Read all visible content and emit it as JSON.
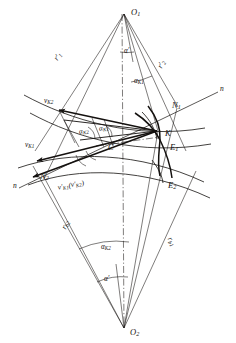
{
  "figure": {
    "type": "technical-line-diagram",
    "background": "#ffffff",
    "ink_color": "#14110f",
    "width": 236,
    "height": 343
  },
  "points": [
    {
      "id": "O1",
      "base": "O",
      "sub": "1",
      "x": 125,
      "y": 12,
      "label_dx": 6,
      "label_dy": 0
    },
    {
      "id": "O2",
      "base": "O",
      "sub": "2",
      "x": 124,
      "y": 329,
      "label_dx": 6,
      "label_dy": 4
    },
    {
      "id": "K",
      "base": "K",
      "sub": "",
      "x": 158,
      "y": 131,
      "label_dx": 7,
      "label_dy": 3
    },
    {
      "id": "C",
      "base": "C",
      "sub": "",
      "x": 112,
      "y": 147,
      "label_dx": 0,
      "label_dy": 0
    },
    {
      "id": "N1",
      "base": "N",
      "sub": "1",
      "x": 176,
      "y": 108,
      "label_dx": 0,
      "label_dy": 0
    },
    {
      "id": "N2",
      "base": "N",
      "sub": "2",
      "x": 45,
      "y": 178,
      "label_dx": 0,
      "label_dy": 0
    },
    {
      "id": "E1",
      "base": "E",
      "sub": "1",
      "x": 174,
      "y": 146,
      "label_dx": 0,
      "label_dy": 0
    },
    {
      "id": "E2",
      "base": "E",
      "sub": "2",
      "x": 172,
      "y": 183,
      "label_dx": 0,
      "label_dy": 0
    }
  ],
  "line_of_action": {
    "name": "n-n",
    "end_label_left": {
      "text": "n",
      "x": 15,
      "y": 185
    },
    "end_label_right": {
      "text": "n",
      "x": 222,
      "y": 90
    }
  },
  "radii": [
    {
      "id": "r1p",
      "base": "r",
      "sup": "′",
      "sub": "1",
      "x": 56,
      "y": 60,
      "rotate": -56
    },
    {
      "id": "r2p",
      "base": "r",
      "sup": "′",
      "sub": "2",
      "x": 159,
      "y": 68,
      "rotate": -63
    },
    {
      "id": "rb2",
      "base": "r",
      "sup": "",
      "sub": "b2",
      "x": 66,
      "y": 228,
      "rotate": -65
    },
    {
      "id": "rb1",
      "base": "r",
      "sup": "",
      "sub": "b1",
      "x": 168,
      "y": 238,
      "rotate": 62
    }
  ],
  "velocity_vectors": [
    {
      "id": "vK2",
      "base": "v",
      "sup": "",
      "sub": "K2",
      "x": 50,
      "y": 102,
      "desc": "velocity of point K on wheel 2"
    },
    {
      "id": "vK1",
      "base": "v",
      "sup": "",
      "sub": "K1",
      "x": 31,
      "y": 146,
      "desc": "velocity of point K on wheel 1"
    },
    {
      "id": "vK1p_vK2p",
      "base": "v",
      "sup": "′",
      "sub": "K1",
      "paren_base": "v",
      "paren_sup": "′",
      "paren_sub": "K2",
      "x": 67,
      "y": 187,
      "desc": "sliding velocity components"
    }
  ],
  "angles": [
    {
      "id": "alpha_top",
      "base": "α",
      "sup": "′",
      "sub": "",
      "x": 130,
      "y": 50,
      "desc": "pressure angle at O1"
    },
    {
      "id": "alpha_K1_top",
      "base": "α",
      "sup": "",
      "sub": "K1",
      "x": 140,
      "y": 80,
      "desc": "profile angle at K, wheel 1"
    },
    {
      "id": "alpha_K2_mid",
      "base": "α",
      "sup": "",
      "sub": "K2",
      "x": 84,
      "y": 131,
      "desc": "profile angle at K, wheel 2"
    },
    {
      "id": "alpha_K1_mid",
      "base": "α",
      "sup": "",
      "sub": "K1",
      "x": 104,
      "y": 128,
      "desc": "profile angle at K, wheel 1"
    },
    {
      "id": "alpha_K2_bot",
      "base": "α",
      "sup": "",
      "sub": "K2",
      "x": 110,
      "y": 246,
      "desc": "profile angle at O2"
    },
    {
      "id": "alpha_bot",
      "base": "α",
      "sup": "′",
      "sub": "",
      "x": 110,
      "y": 278,
      "desc": "pressure angle at O2"
    }
  ]
}
